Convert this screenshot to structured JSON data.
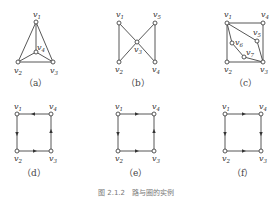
{
  "figure": {
    "caption": "图 2.1.2　路与圈的实例",
    "panels": [
      {
        "id": "a",
        "label": "（a）",
        "vertices": [
          "v1",
          "v2",
          "v3",
          "v4"
        ],
        "edges": [
          [
            "v1",
            "v2"
          ],
          [
            "v1",
            "v3"
          ],
          [
            "v2",
            "v3"
          ],
          [
            "v1",
            "v4"
          ],
          [
            "v2",
            "v4"
          ],
          [
            "v3",
            "v4"
          ]
        ],
        "directed": false
      },
      {
        "id": "b",
        "label": "（b）",
        "vertices": [
          "v1",
          "v2",
          "v3",
          "v4",
          "v5"
        ],
        "edges": [
          [
            "v1",
            "v2"
          ],
          [
            "v1",
            "v3"
          ],
          [
            "v2",
            "v3"
          ],
          [
            "v3",
            "v5"
          ],
          [
            "v3",
            "v4"
          ],
          [
            "v5",
            "v4"
          ]
        ],
        "directed": false
      },
      {
        "id": "c",
        "label": "（c）",
        "vertices": [
          "v1",
          "v2",
          "v3",
          "v4",
          "v5",
          "v6",
          "v7"
        ],
        "edges": [
          [
            "v1",
            "v4"
          ],
          [
            "v4",
            "v3"
          ],
          [
            "v1",
            "v2"
          ],
          [
            "v2",
            "v3"
          ],
          [
            "v1",
            "v5"
          ],
          [
            "v5",
            "v3"
          ],
          [
            "v1",
            "v6"
          ],
          [
            "v6",
            "v7"
          ],
          [
            "v7",
            "v3"
          ]
        ],
        "directed": false
      },
      {
        "id": "d",
        "label": "（d）",
        "vertices": [
          "v1",
          "v2",
          "v3",
          "v4"
        ],
        "edges": [
          [
            "v4",
            "v1"
          ],
          [
            "v1",
            "v2"
          ],
          [
            "v2",
            "v3"
          ],
          [
            "v3",
            "v4"
          ]
        ],
        "directed": true
      },
      {
        "id": "e",
        "label": "（e）",
        "vertices": [
          "v1",
          "v2",
          "v3",
          "v4"
        ],
        "edges": [
          [
            "v1",
            "v4"
          ],
          [
            "v1",
            "v2"
          ],
          [
            "v2",
            "v3"
          ],
          [
            "v3",
            "v4"
          ]
        ],
        "directed": true
      },
      {
        "id": "f",
        "label": "（f）",
        "vertices": [
          "v1",
          "v2",
          "v3",
          "v4"
        ],
        "edges": [
          [
            "v1",
            "v4"
          ],
          [
            "v1",
            "v2"
          ],
          [
            "v2",
            "v3"
          ],
          [
            "v4",
            "v3"
          ]
        ],
        "directed": true
      }
    ]
  },
  "labels": {
    "v1": "v",
    "v2": "v",
    "v3": "v",
    "v4": "v",
    "v5": "v",
    "v6": "v",
    "v7": "v",
    "s1": "1",
    "s2": "2",
    "s3": "3",
    "s4": "4",
    "s5": "5",
    "s6": "6",
    "s7": "7"
  }
}
